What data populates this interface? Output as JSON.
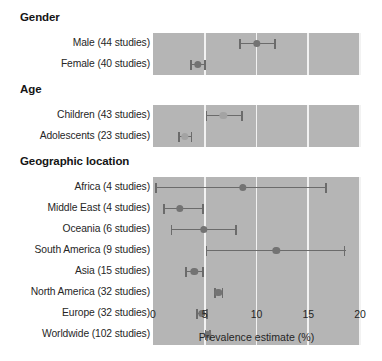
{
  "chart_data": {
    "type": "forest",
    "title": "",
    "xlabel": "Prevalence estimate (%)",
    "ylabel": "",
    "xlim": [
      0,
      20
    ],
    "xticks": [
      0,
      5,
      10,
      15,
      20
    ],
    "xtick_labels": [
      "0",
      "5",
      "10",
      "15",
      "20"
    ],
    "grid": "vertical-white-gridlines-at-xticks",
    "legend": "none",
    "value_unit": "%",
    "groups": [
      {
        "heading": "Gender",
        "rows": [
          {
            "label": "Male (44 studies)",
            "studies": 44,
            "estimate": 10.0,
            "ci_low": 8.3,
            "ci_high": 11.9,
            "marker": "dark"
          },
          {
            "label": "Female (40 studies)",
            "studies": 40,
            "estimate": 4.3,
            "ci_low": 3.6,
            "ci_high": 5.1,
            "marker": "dark"
          }
        ]
      },
      {
        "heading": "Age",
        "rows": [
          {
            "label": "Children (43 studies)",
            "studies": 43,
            "estimate": 6.8,
            "ci_low": 5.1,
            "ci_high": 8.7,
            "marker": "light"
          },
          {
            "label": "Adolescents (23 studies)",
            "studies": 23,
            "estimate": 3.1,
            "ci_low": 2.4,
            "ci_high": 3.8,
            "marker": "light"
          }
        ]
      },
      {
        "heading": "Geographic location",
        "rows": [
          {
            "label": "Africa (4 studies)",
            "studies": 4,
            "estimate": 8.7,
            "ci_low": 0.2,
            "ci_high": 16.8,
            "marker": "dark"
          },
          {
            "label": "Middle East (4 studies)",
            "studies": 4,
            "estimate": 2.6,
            "ci_low": 1.0,
            "ci_high": 4.9,
            "marker": "dark"
          },
          {
            "label": "Oceania (6 studies)",
            "studies": 6,
            "estimate": 4.9,
            "ci_low": 1.7,
            "ci_high": 8.1,
            "marker": "dark"
          },
          {
            "label": "South America (9 studies)",
            "studies": 9,
            "estimate": 11.9,
            "ci_low": 5.1,
            "ci_high": 18.6,
            "marker": "dark"
          },
          {
            "label": "Asia (15 studies)",
            "studies": 15,
            "estimate": 4.0,
            "ci_low": 3.1,
            "ci_high": 4.9,
            "marker": "dark"
          },
          {
            "label": "North America (32 studies)",
            "studies": 32,
            "estimate": 6.3,
            "ci_low": 5.9,
            "ci_high": 6.8,
            "marker": "dark"
          },
          {
            "label": "Europe (32 studies)",
            "studies": 32,
            "estimate": 4.7,
            "ci_low": 4.2,
            "ci_high": 5.3,
            "marker": "dark"
          },
          {
            "label": "Worldwide (102 studies)",
            "studies": 102,
            "estimate": 5.3,
            "ci_low": 5.0,
            "ci_high": 5.6,
            "marker": "dark"
          }
        ]
      }
    ],
    "colors": {
      "band_background": "#b5b5b5",
      "gridline": "#f2f2f2",
      "marker_dark": "#737373",
      "marker_light": "#a3a3a3",
      "ci_line": "#6b6b6b",
      "text": "#262626",
      "page_background": "#ffffff"
    }
  }
}
